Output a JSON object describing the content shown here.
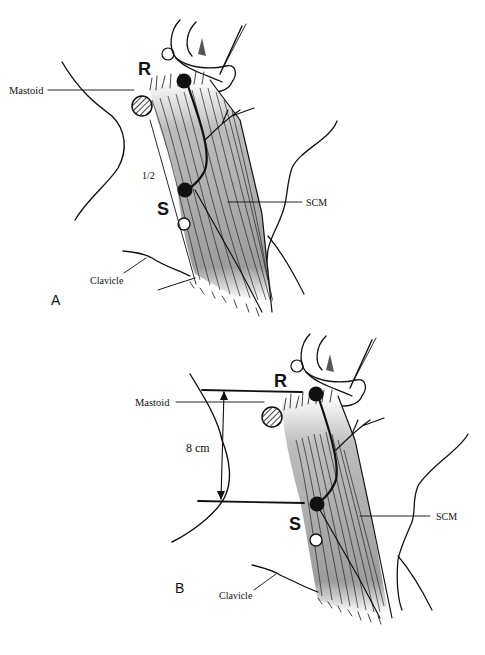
{
  "figure": {
    "panels": [
      {
        "id": "A",
        "panel_label": "A",
        "labels": {
          "mastoid": "Mastoid",
          "clavicle": "Clavicle",
          "scm": "SCM",
          "point_r": "R",
          "point_s": "S",
          "fraction": "1/2"
        }
      },
      {
        "id": "B",
        "panel_label": "B",
        "labels": {
          "mastoid": "Mastoid",
          "clavicle": "Clavicle",
          "scm": "SCM",
          "point_r": "R",
          "point_s": "S",
          "distance": "8 cm"
        }
      }
    ],
    "colors": {
      "ink": "#111111",
      "muscle_shade": "#a8a8a8",
      "background": "#ffffff"
    }
  }
}
